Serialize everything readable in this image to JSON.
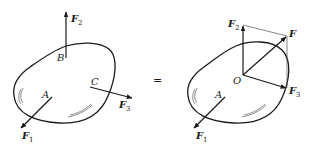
{
  "diagram": {
    "colors": {
      "ink": "#1a1a1a",
      "background": "#ffffff",
      "construction": "#555555"
    },
    "equals_sign": "=",
    "left": {
      "points": {
        "A": "A",
        "B": "B",
        "C": "C"
      },
      "forces": [
        {
          "name": "F",
          "sub": "1",
          "at": "A"
        },
        {
          "name": "F",
          "sub": "2",
          "at": "B"
        },
        {
          "name": "F",
          "sub": "3",
          "at": "C"
        }
      ]
    },
    "right": {
      "points": {
        "A": "A",
        "O": "O"
      },
      "forces": [
        {
          "name": "F",
          "sub": "1",
          "at": "A"
        },
        {
          "name": "F",
          "sub": "2",
          "at": "O"
        },
        {
          "name": "F",
          "sub": "3",
          "at": "O"
        }
      ],
      "resultant": {
        "name": "F"
      }
    }
  }
}
